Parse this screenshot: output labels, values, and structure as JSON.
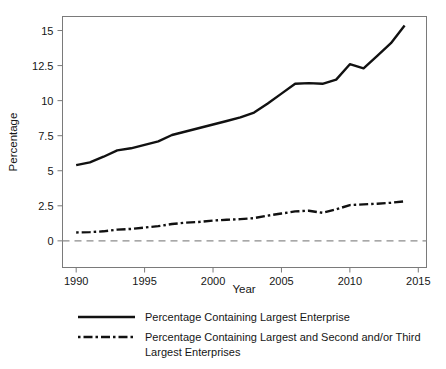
{
  "chart_data": {
    "type": "line",
    "title": "",
    "xlabel": "Year",
    "ylabel": "Percentage",
    "xlim": [
      1989.0,
      2015.6
    ],
    "ylim": [
      -1.9,
      16.0
    ],
    "xticks": [
      1990,
      1995,
      2000,
      2005,
      2010,
      2015
    ],
    "xtick_labels": [
      "1990",
      "1995",
      "2000",
      "2005",
      "2010",
      "2015"
    ],
    "yticks": [
      0,
      2.5,
      5,
      7.5,
      10,
      12.5,
      15
    ],
    "ytick_labels": [
      "0",
      "2.5",
      "5",
      "7.5",
      "10",
      "12.5",
      "15"
    ],
    "grid": false,
    "legend_position": "below",
    "reference_line": {
      "y": 0,
      "style": "dashed",
      "color": "#8c8c8c"
    },
    "x": [
      1990,
      1991,
      1992,
      1993,
      1994,
      1995,
      1996,
      1997,
      1998,
      1999,
      2000,
      2001,
      2002,
      2003,
      2004,
      2005,
      2006,
      2007,
      2008,
      2009,
      2010,
      2011,
      2012,
      2013,
      2014
    ],
    "series": [
      {
        "name": "Percentage Containing Largest Enterprise",
        "style": "solid",
        "color": "#111111",
        "values": [
          5.4,
          5.6,
          6.0,
          6.45,
          6.6,
          6.85,
          7.1,
          7.55,
          7.8,
          8.05,
          8.3,
          8.55,
          8.8,
          9.15,
          9.8,
          10.5,
          11.2,
          11.25,
          11.2,
          11.5,
          12.6,
          12.3,
          13.2,
          14.1,
          15.35
        ]
      },
      {
        "name": "Percentage Containing Largest and Second and/or Third Largest Enterprises",
        "style": "dash-dot",
        "color": "#111111",
        "values": [
          0.6,
          0.62,
          0.68,
          0.8,
          0.85,
          0.95,
          1.05,
          1.2,
          1.3,
          1.35,
          1.45,
          1.5,
          1.55,
          1.62,
          1.8,
          1.95,
          2.1,
          2.15,
          2.0,
          2.25,
          2.55,
          2.6,
          2.65,
          2.72,
          2.82
        ]
      }
    ]
  },
  "legend": {
    "entries": [
      {
        "label": "Percentage Containing Largest Enterprise",
        "style": "solid"
      },
      {
        "label": "Percentage Containing Largest and Second and/or Third",
        "label2": "Largest Enterprises",
        "style": "dash-dot"
      }
    ]
  }
}
